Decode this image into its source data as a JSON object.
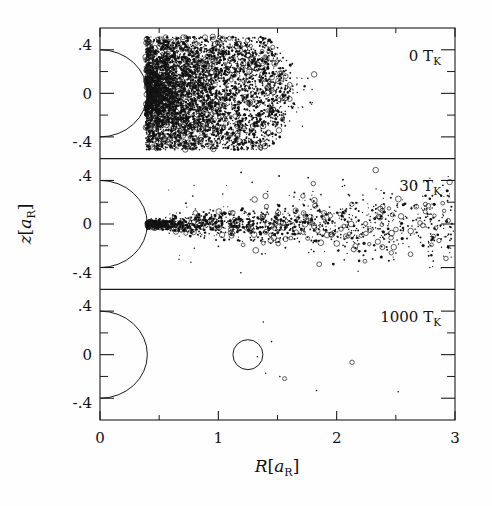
{
  "figure": {
    "width": 492,
    "height": 506,
    "background": "#fefefe",
    "ink_color": "#111111"
  },
  "chart_data": {
    "type": "scatter",
    "title": "",
    "subtitle": "",
    "xlabel": "R[a_R]",
    "ylabel": "z[a_R]",
    "xlim": [
      0,
      3
    ],
    "ylim": [
      -0.6,
      0.6
    ],
    "grid": false,
    "legend_position": "inside-top-right",
    "panel_count": 3,
    "shared_x_axis": true,
    "x_ticks_major": [
      0,
      1,
      2,
      3
    ],
    "x_tick_labels": [
      "0",
      "1",
      "2",
      "3"
    ],
    "x_ticks_minor": [
      0.5,
      1.5,
      2.5
    ],
    "y_ticks_major": [
      -0.4,
      0,
      0.4
    ],
    "y_tick_labels": [
      "-.4",
      "0",
      ".4"
    ],
    "y_ticks_minor": [
      -0.2,
      0.2
    ],
    "central_sphere_radius": 0.4,
    "central_sphere_note": "half-circle drawn at R=0 with radius 0.4 a_R in each panel",
    "panels": [
      {
        "id": "panel-0TK",
        "label": "0 T",
        "label_sub": "K",
        "temperature": 0,
        "temperature_unit": "T_K",
        "n_points_approx": 5000,
        "description": "dense spheroidal cloud hugging the central sphere, extending to R~1.6",
        "r_extent": [
          0.4,
          1.65
        ],
        "z_extent": [
          -0.52,
          0.52
        ],
        "ylim": [
          -0.6,
          0.6
        ]
      },
      {
        "id": "panel-30TK",
        "label": "30 T",
        "label_sub": "K",
        "temperature": 30,
        "temperature_unit": "T_K",
        "n_points_approx": 1500,
        "description": "narrow dense jet along z=0 from the sphere surface, fanning out and thinning toward R=3",
        "r_extent": [
          0.4,
          3.0
        ],
        "z_extent": [
          -0.45,
          0.45
        ],
        "ylim": [
          -0.6,
          0.6
        ]
      },
      {
        "id": "panel-1000TK",
        "label": "1000 T",
        "label_sub": "K",
        "temperature": 1000,
        "temperature_unit": "T_K",
        "n_points_approx": 9,
        "description": "nearly empty panel; one large open circle near R=1.25 z=0 plus a few tiny specks",
        "r_extent": [
          1.1,
          2.6
        ],
        "z_extent": [
          -0.3,
          0.35
        ],
        "ylim": [
          -0.6,
          0.6
        ],
        "marked_objects": [
          {
            "r": 1.25,
            "z": 0.0,
            "radius_px": 15,
            "style": "open-circle"
          }
        ]
      }
    ]
  },
  "axes": {
    "x_title_main": "R",
    "x_title_bracket_open": "[",
    "x_title_var": "a",
    "x_title_sub": "R",
    "x_title_bracket_close": "]",
    "y_title_main": "z",
    "y_title_bracket_open": "[",
    "y_title_var": "a",
    "y_title_sub": "R",
    "y_title_bracket_close": "]"
  }
}
